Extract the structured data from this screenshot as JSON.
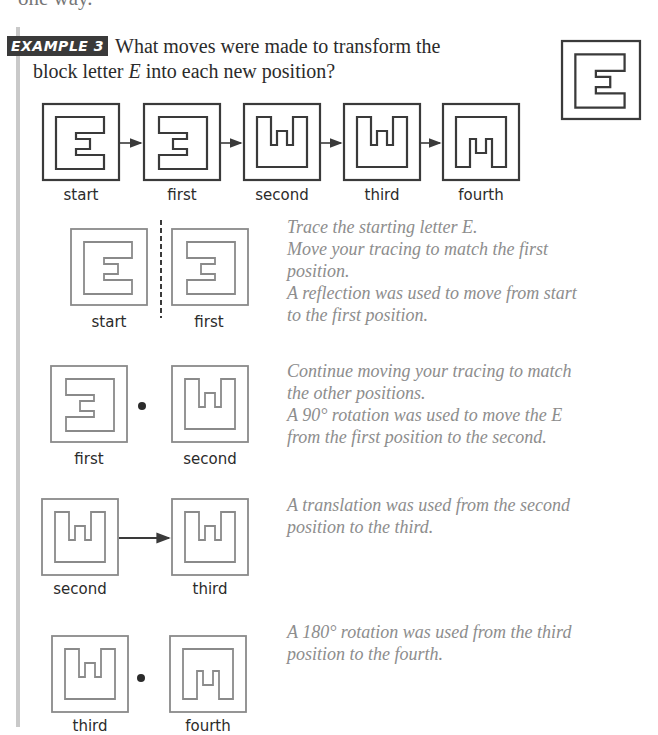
{
  "page": {
    "top_fragment": "one way."
  },
  "example": {
    "badge": "EXAMPLE 3",
    "question_line1": "What moves were made to transform the",
    "question_line2_pre": "block letter ",
    "question_letter": "E",
    "question_line2_post": " into each new position?"
  },
  "sequence": {
    "labels": [
      "start",
      "first",
      "second",
      "third",
      "fourth"
    ]
  },
  "steps": [
    {
      "labels": [
        "start",
        "first"
      ],
      "separator": "dashed-line",
      "notes": [
        "Trace the starting letter E.",
        "Move your tracing to match the first",
        "position.",
        "A reflection was used to move from start",
        "to the first position."
      ]
    },
    {
      "labels": [
        "first",
        "second"
      ],
      "separator": "dot",
      "notes": [
        "Continue moving your tracing to match",
        "the other positions.",
        "A 90° rotation was used to move the E",
        "from the first position to the second."
      ]
    },
    {
      "labels": [
        "second",
        "third"
      ],
      "separator": "arrow",
      "notes": [
        "A translation was used from the second",
        "position to the third."
      ]
    },
    {
      "labels": [
        "third",
        "fourth"
      ],
      "separator": "dot",
      "notes": [
        "A 180° rotation was used from the third",
        "position to the fourth."
      ]
    }
  ],
  "colors": {
    "ink": "#2b2b2b",
    "note_text": "#8d8d8d",
    "badge_bg": "#3a3a3a",
    "left_bar": "#c9c9c9",
    "figure_stroke_dark": "#3a3a3a",
    "figure_stroke_light": "#8a8a8a"
  }
}
